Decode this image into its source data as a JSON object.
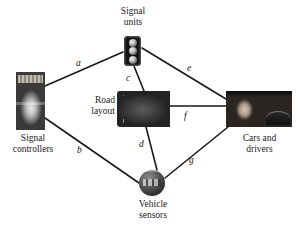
{
  "figure": {
    "type": "node-link-diagram",
    "background_color": "#ffffff",
    "line_color": "#1a1a1a"
  },
  "nodes": [
    {
      "id": "signal-units",
      "label_line1": "Signal",
      "label_line2": "units",
      "icon": "traffic-light-icon",
      "label_position": "above"
    },
    {
      "id": "signal-controllers",
      "label_line1": "Signal",
      "label_line2": "controllers",
      "icon": "signal-controller-photo",
      "label_position": "below"
    },
    {
      "id": "road-layout",
      "label_line1": "Road",
      "label_line2": "layout",
      "icon": "road-layout-photo",
      "label_position": "left"
    },
    {
      "id": "cars-drivers",
      "label_line1": "Cars and",
      "label_line2": "drivers",
      "icon": "cars-and-drivers-photo",
      "label_position": "below"
    },
    {
      "id": "vehicle-sensors",
      "label_line1": "Vehicle",
      "label_line2": "sensors",
      "icon": "vehicle-sensor-sphere-icon",
      "label_position": "below"
    }
  ],
  "edges": [
    {
      "id": "a",
      "label": "a",
      "from": "signal-controllers",
      "to": "signal-units"
    },
    {
      "id": "b",
      "label": "b",
      "from": "signal-controllers",
      "to": "vehicle-sensors"
    },
    {
      "id": "c",
      "label": "c",
      "from": "signal-units",
      "to": "road-layout"
    },
    {
      "id": "d",
      "label": "d",
      "from": "road-layout",
      "to": "vehicle-sensors"
    },
    {
      "id": "e",
      "label": "e",
      "from": "signal-units",
      "to": "cars-drivers"
    },
    {
      "id": "f",
      "label": "f",
      "from": "road-layout",
      "to": "cars-drivers"
    },
    {
      "id": "g",
      "label": "g",
      "from": "vehicle-sensors",
      "to": "cars-drivers"
    }
  ]
}
